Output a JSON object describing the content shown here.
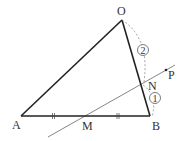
{
  "diagram": {
    "type": "geometry",
    "points": {
      "O": {
        "label": "O",
        "x": 122,
        "y": 20
      },
      "A": {
        "label": "A",
        "x": 21,
        "y": 116
      },
      "B": {
        "label": "B",
        "x": 150,
        "y": 116
      },
      "M": {
        "label": "M",
        "x": 86,
        "y": 116
      },
      "N": {
        "label": "N",
        "x": 142,
        "y": 84
      },
      "P": {
        "label": "P",
        "x": 166,
        "y": 70
      }
    },
    "ratio_labels": {
      "ON": "2",
      "NB": "1"
    },
    "colors": {
      "stroke": "#222222",
      "thin": "#666666",
      "dashed": "#888888"
    }
  }
}
